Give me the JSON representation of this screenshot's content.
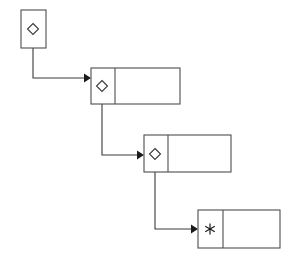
{
  "diagram": {
    "type": "linked-list",
    "background_color": "#ffffff",
    "line_color": "#3a3a3a",
    "box_stroke_color": "#4d4d4d",
    "arrow_color": "#1a1a1a",
    "node_count": 4,
    "nodes": [
      {
        "id": "node-1",
        "label": "",
        "glyph": "diamond",
        "glyph_text": "◇",
        "cells": 1,
        "x": 21,
        "y": 10,
        "width": 25,
        "height": 38,
        "divider_x": null,
        "glyph_cx": 33,
        "glyph_cy": 29
      },
      {
        "id": "node-2",
        "label": "",
        "glyph": "diamond",
        "glyph_text": "◇",
        "cells": 2,
        "x": 91,
        "y": 68,
        "width": 89,
        "height": 36,
        "divider_x": 115,
        "glyph_cx": 102,
        "glyph_cy": 86
      },
      {
        "id": "node-3",
        "label": "",
        "glyph": "diamond",
        "glyph_text": "◇",
        "cells": 2,
        "x": 144,
        "y": 135,
        "width": 87,
        "height": 37,
        "divider_x": 168,
        "glyph_cx": 155,
        "glyph_cy": 154
      },
      {
        "id": "node-4",
        "label": "*",
        "glyph": "asterisk",
        "glyph_text": "∗",
        "cells": 2,
        "x": 198,
        "y": 210,
        "width": 82,
        "height": 38,
        "divider_x": 223,
        "glyph_cx": 210,
        "glyph_cy": 229
      }
    ],
    "connectors": [
      {
        "id": "connector-1",
        "from": "node-1",
        "to": "node-2",
        "path": "M 33 29 L 33 78 L 84 78",
        "arrow_points": "84,73.5 91,78 84,82.5",
        "arrow_tip_x": 91,
        "arrow_tip_y": 78
      },
      {
        "id": "connector-2",
        "from": "node-2",
        "to": "node-3",
        "path": "M 102 86 L 102 155 L 137 155",
        "arrow_points": "137,150.5 144,155 137,159.5",
        "arrow_tip_x": 144,
        "arrow_tip_y": 155
      },
      {
        "id": "connector-3",
        "from": "node-3",
        "to": "node-4",
        "path": "M 155 154 L 155 229 L 191 229",
        "arrow_points": "191,224.5 198,229 191,233.5",
        "arrow_tip_x": 198,
        "arrow_tip_y": 229
      }
    ],
    "glyph_sizes": {
      "diamond_radius": 5.5,
      "asterisk_radius": 5.5
    }
  }
}
